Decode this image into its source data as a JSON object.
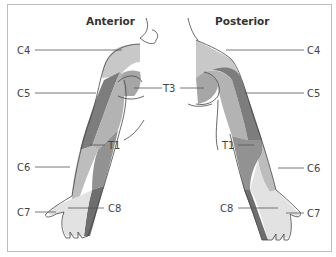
{
  "diagram": {
    "views": [
      {
        "id": "anterior",
        "title": "Anterior"
      },
      {
        "id": "posterior",
        "title": "Posterior"
      }
    ],
    "labels": {
      "anterior": {
        "c4": "C4",
        "c5": "C5",
        "c6": "C6",
        "c7": "C7",
        "c8": "C8",
        "t1": "T1"
      },
      "posterior": {
        "c4": "C4",
        "c5": "C5",
        "c6": "C6",
        "c7": "C7",
        "c8": "C8",
        "t1": "T1"
      },
      "shared": {
        "t3": "T3"
      }
    },
    "colors": {
      "c4": "#c8c8c8",
      "c5": "#7d7d7d",
      "t3": "#a6a6a6",
      "t2": "#b3b3b3",
      "t1": "#929292",
      "c6": "#bdbdbd",
      "c7": "#e2e2e2",
      "c8": "#6e6e6e",
      "outline": "#444444",
      "frame": "#bdbdbd"
    }
  }
}
